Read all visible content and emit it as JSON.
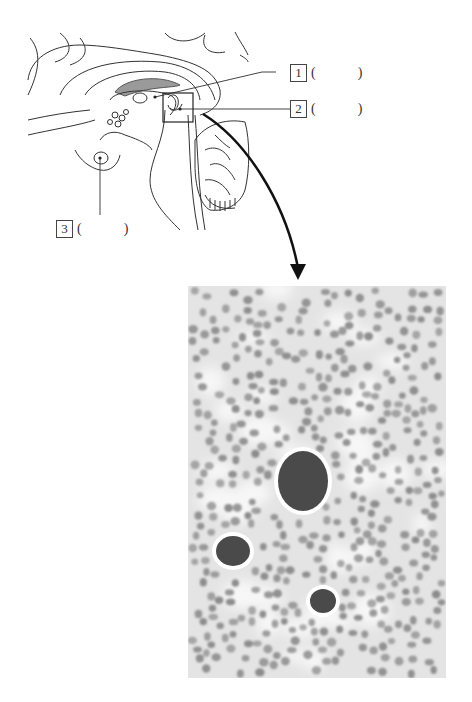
{
  "figure": {
    "type": "anatomy worksheet"
  },
  "labels": [
    {
      "number": "1",
      "open": "(",
      "close": ")",
      "answer": ""
    },
    {
      "number": "2",
      "open": "(",
      "close": ")",
      "answer": ""
    },
    {
      "number": "3",
      "open": "(",
      "close": ")",
      "answer": ""
    }
  ],
  "colors": {
    "line": "#333333",
    "corpus_callosum_fill": "#9a9a9a",
    "micrograph_bg": "#e6e6e6",
    "cell_nuclei": "#8f8f8f",
    "large_cells": "#4a4a4a",
    "arrow": "#111111"
  },
  "micrograph": {
    "large_cells": [
      {
        "cx": 115,
        "cy": 195,
        "rx": 25,
        "ry": 30
      },
      {
        "cx": 45,
        "cy": 265,
        "rx": 17,
        "ry": 15
      },
      {
        "cx": 135,
        "cy": 315,
        "rx": 13,
        "ry": 12
      }
    ]
  }
}
